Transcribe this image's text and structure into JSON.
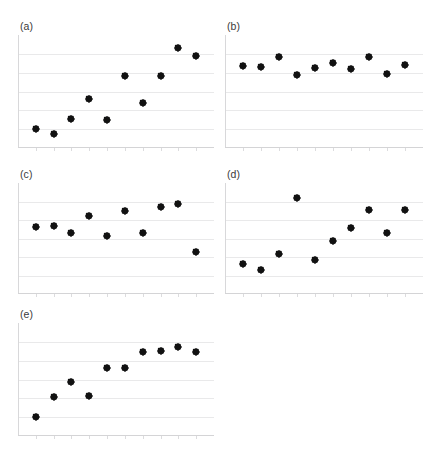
{
  "figure": {
    "background_color": "#ffffff",
    "marker_color": "#1a1a1a",
    "gridline_color": "#e9e9ea",
    "axis_color": "#d8d8da",
    "label_color": "#3a3a3a",
    "panel_count": 5,
    "marker_shape": "diamond"
  },
  "chart_data": [
    {
      "type": "scatter",
      "title": "(a)",
      "xlabel": "",
      "ylabel": "",
      "xlim": [
        0,
        11
      ],
      "ylim": [
        0,
        6
      ],
      "grid": true,
      "gridlines_y": [
        1,
        2,
        3,
        4,
        5
      ],
      "legend": null,
      "xticklabels": [],
      "yticklabels": [],
      "x": [
        1,
        2,
        3,
        4,
        5,
        6,
        7,
        8,
        9,
        10
      ],
      "y": [
        1.0,
        0.72,
        1.55,
        2.62,
        1.5,
        3.82,
        2.4,
        3.82,
        5.3,
        4.9
      ]
    },
    {
      "type": "scatter",
      "title": "(b)",
      "xlabel": "",
      "ylabel": "",
      "xlim": [
        0,
        11
      ],
      "ylim": [
        0,
        6
      ],
      "grid": true,
      "gridlines_y": [
        1,
        2,
        3,
        4,
        5
      ],
      "legend": null,
      "xticklabels": [],
      "yticklabels": [],
      "x": [
        1,
        2,
        3,
        4,
        5,
        6,
        7,
        8,
        9,
        10
      ],
      "y": [
        4.35,
        4.3,
        4.85,
        3.85,
        4.25,
        4.52,
        4.18,
        4.85,
        3.95,
        4.4
      ]
    },
    {
      "type": "scatter",
      "title": "(c)",
      "xlabel": "",
      "ylabel": "",
      "xlim": [
        0,
        11
      ],
      "ylim": [
        0,
        6
      ],
      "grid": true,
      "gridlines_y": [
        1,
        2,
        3,
        4,
        5
      ],
      "legend": null,
      "xticklabels": [],
      "yticklabels": [],
      "x": [
        1,
        2,
        3,
        4,
        5,
        6,
        7,
        8,
        9,
        10
      ],
      "y": [
        3.6,
        3.68,
        3.28,
        4.2,
        3.12,
        4.5,
        3.3,
        4.72,
        4.88,
        2.25
      ]
    },
    {
      "type": "scatter",
      "title": "(d)",
      "xlabel": "",
      "ylabel": "",
      "xlim": [
        0,
        11
      ],
      "ylim": [
        0,
        6
      ],
      "grid": true,
      "gridlines_y": [
        1,
        2,
        3,
        4,
        5
      ],
      "legend": null,
      "xticklabels": [],
      "yticklabels": [],
      "x": [
        1,
        2,
        3,
        4,
        5,
        6,
        7,
        8,
        9,
        10
      ],
      "y": [
        1.62,
        1.3,
        2.15,
        5.2,
        1.85,
        2.85,
        3.55,
        4.55,
        3.3,
        4.55
      ]
    },
    {
      "type": "scatter",
      "title": "(e)",
      "xlabel": "",
      "ylabel": "",
      "xlim": [
        0,
        11
      ],
      "ylim": [
        0,
        6
      ],
      "grid": true,
      "gridlines_y": [
        1,
        2,
        3,
        4,
        5
      ],
      "legend": null,
      "xticklabels": [],
      "yticklabels": [],
      "x": [
        1,
        2,
        3,
        4,
        5,
        6,
        7,
        8,
        9,
        10
      ],
      "y": [
        1.0,
        2.05,
        2.85,
        2.1,
        3.6,
        3.62,
        4.45,
        4.5,
        4.75,
        4.45
      ]
    }
  ],
  "panels": [
    {
      "label": "(a)",
      "left": 18,
      "top": 20,
      "width": 196,
      "height": 128
    },
    {
      "label": "(b)",
      "left": 225,
      "top": 20,
      "width": 198,
      "height": 128
    },
    {
      "label": "(c)",
      "left": 18,
      "top": 168,
      "width": 196,
      "height": 126
    },
    {
      "label": "(d)",
      "left": 225,
      "top": 168,
      "width": 198,
      "height": 126
    },
    {
      "label": "(e)",
      "left": 18,
      "top": 308,
      "width": 196,
      "height": 128
    }
  ]
}
